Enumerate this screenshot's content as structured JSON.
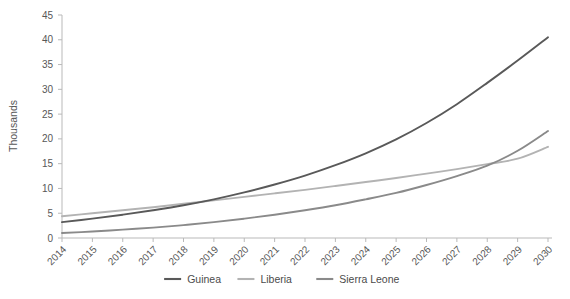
{
  "chart_data": {
    "type": "line",
    "title": "",
    "subtitle": "",
    "xlabel": "",
    "ylabel": "Thousands",
    "x": [
      2014,
      2015,
      2016,
      2017,
      2018,
      2019,
      2020,
      2021,
      2022,
      2023,
      2024,
      2025,
      2026,
      2027,
      2028,
      2029,
      2030
    ],
    "categories": [
      "2014",
      "2015",
      "2016",
      "2017",
      "2018",
      "2019",
      "2020",
      "2021",
      "2022",
      "2023",
      "2024",
      "2025",
      "2026",
      "2027",
      "2028",
      "2029",
      "2030"
    ],
    "ylim": [
      0,
      45
    ],
    "yticks": [
      0,
      5,
      10,
      15,
      20,
      25,
      30,
      35,
      40,
      45
    ],
    "ytick_labels": [
      "0",
      "5",
      "10",
      "15",
      "20",
      "25",
      "30",
      "35",
      "40",
      "45"
    ],
    "grid": false,
    "legend_position": "bottom",
    "series": [
      {
        "name": "Guinea",
        "color": "#595959",
        "values": [
          3.2,
          3.9,
          4.7,
          5.6,
          6.6,
          7.8,
          9.2,
          10.8,
          12.6,
          14.7,
          17.1,
          19.9,
          23.2,
          27.0,
          31.3,
          35.8,
          40.5
        ]
      },
      {
        "name": "Liberia",
        "color": "#b3b3b3",
        "values": [
          4.4,
          5.0,
          5.6,
          6.2,
          6.9,
          7.6,
          8.3,
          9.0,
          9.7,
          10.5,
          11.3,
          12.1,
          13.0,
          13.9,
          14.9,
          16.0,
          18.4
        ]
      },
      {
        "name": "Sierra Leone",
        "color": "#8a8a8a",
        "values": [
          1.0,
          1.3,
          1.7,
          2.1,
          2.6,
          3.2,
          3.9,
          4.7,
          5.6,
          6.6,
          7.8,
          9.1,
          10.7,
          12.5,
          14.6,
          17.6,
          21.6
        ]
      }
    ],
    "annotations": []
  },
  "legend": {
    "items": [
      {
        "label": "Guinea",
        "color": "#595959"
      },
      {
        "label": "Liberia",
        "color": "#b3b3b3"
      },
      {
        "label": "Sierra Leone",
        "color": "#8a8a8a"
      }
    ]
  },
  "axes": {
    "y_axis_title": "Thousands"
  }
}
